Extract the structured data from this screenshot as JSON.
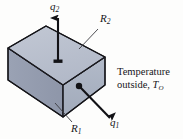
{
  "figure": {
    "colors": {
      "top_face": "#b9c0cd",
      "front_face": "#aab2c2",
      "left_face": "#98a0b2",
      "outline": "#1b1b20",
      "arrow": "#121216",
      "background": "#fdfdfc",
      "leader_line": "#3a3a40"
    },
    "labels": {
      "q2": {
        "base": "q",
        "sub": "2",
        "name": "heat-flux-up"
      },
      "q1": {
        "base": "q",
        "sub": "1",
        "name": "heat-flux-out"
      },
      "r2": {
        "base": "R",
        "sub": "2",
        "name": "resistance-top"
      },
      "r1": {
        "base": "R",
        "sub": "1",
        "name": "resistance-front"
      },
      "temperature": {
        "line1": "Temperature",
        "line2_text": "outside, ",
        "line2_symbol": "T",
        "line2_sub": "O"
      }
    },
    "geometry": {
      "top_face_points": "8,48 46,26 105,57 63,85",
      "front_face_points": "63,85 105,57 105,85 63,117",
      "left_face_points": "8,48 63,85 63,117 8,80",
      "arrow_up": {
        "x": 58,
        "y_tail": 61,
        "y_head": 16
      },
      "arrow_diag": {
        "x1": 79,
        "y1": 86,
        "x2": 112,
        "y2": 120
      },
      "dot": {
        "cx": 79,
        "cy": 86,
        "r": 3.1
      },
      "leader_r2": {
        "x1": 94,
        "y1": 31,
        "x2": 80,
        "y2": 48
      },
      "leader_r1": {
        "x1": 70,
        "y1": 121,
        "x2": 56,
        "y2": 104
      }
    }
  }
}
